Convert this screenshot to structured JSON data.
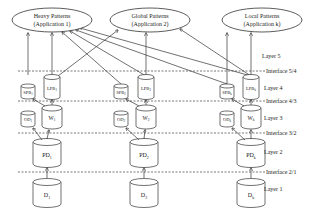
{
  "applications": [
    {
      "title": "Heavy Patterns",
      "subtitle": "(Application 1)",
      "cx": 52,
      "cy": 20,
      "rx": 40,
      "ry": 12
    },
    {
      "title": "Global Patterns",
      "subtitle": "(Application 2)",
      "cx": 150,
      "cy": 20,
      "rx": 40,
      "ry": 12
    },
    {
      "title": "Local Patterns",
      "subtitle": "(Application k)",
      "cx": 262,
      "cy": 20,
      "rx": 40,
      "ry": 12
    }
  ],
  "layers": [
    {
      "label": "Layer 5",
      "y": 56
    },
    {
      "label": "Layer 4",
      "y": 88
    },
    {
      "label": "Layer 3",
      "y": 118
    },
    {
      "label": "Layer 2",
      "y": 152
    },
    {
      "label": "Layer 1",
      "y": 189
    }
  ],
  "interfaces": [
    {
      "label": "Interface 5/4",
      "y": 71
    },
    {
      "label": "Interface 4/3",
      "y": 101
    },
    {
      "label": "Interface 3/2",
      "y": 133
    },
    {
      "label": "Interface 2/1",
      "y": 172
    }
  ],
  "columns": [
    {
      "spb": "SPB",
      "spb_sub": "1",
      "lpb": "LPB",
      "lpb_sub": "1",
      "od": "OD",
      "od_sub": "1",
      "w": "W",
      "w_sub": "1",
      "pd": "PD",
      "pd_sub": "1",
      "d": "D",
      "d_sub": "1",
      "spb_x": 28,
      "lpb_x": 52
    },
    {
      "spb": "SPB",
      "spb_sub": "2",
      "lpb": "LPB",
      "lpb_sub": "2",
      "od": "OD",
      "od_sub": "2",
      "w": "W",
      "w_sub": "2",
      "pd": "PD",
      "pd_sub": "2",
      "d": "D",
      "d_sub": "2",
      "spb_x": 121,
      "lpb_x": 146
    },
    {
      "spb": "SPB",
      "spb_sub": "k",
      "lpb": "LPB",
      "lpb_sub": "k",
      "od": "OD",
      "od_sub": "k",
      "w": "W",
      "w_sub": "k",
      "pd": "PD",
      "pd_sub": "k",
      "d": "D",
      "d_sub": "k",
      "spb_x": 227,
      "lpb_x": 251
    }
  ],
  "colors": {
    "line": "#333333",
    "dash": "#555555",
    "text": "#222222",
    "background": "#ffffff"
  }
}
